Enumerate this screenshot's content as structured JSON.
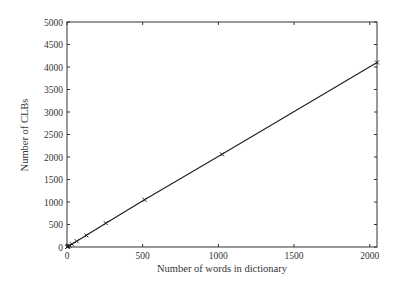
{
  "chart_data": {
    "type": "line",
    "title": "",
    "xlabel": "Number of words in dictionary",
    "ylabel": "Number of CLBs",
    "xlim": [
      0,
      2048
    ],
    "ylim": [
      0,
      5000
    ],
    "xticks": [
      0,
      500,
      1000,
      1500,
      2000
    ],
    "yticks": [
      0,
      500,
      1000,
      1500,
      2000,
      2500,
      3000,
      3500,
      4000,
      4500,
      5000
    ],
    "grid": false,
    "legend": null,
    "series": [
      {
        "name": "CLBs",
        "marker": "x",
        "line": "solid",
        "color": "#222222",
        "x": [
          2,
          4,
          8,
          16,
          32,
          64,
          128,
          256,
          512,
          1024,
          2048
        ],
        "y": [
          4,
          8,
          16,
          32,
          64,
          128,
          260,
          530,
          1050,
          2060,
          4100
        ]
      }
    ]
  }
}
